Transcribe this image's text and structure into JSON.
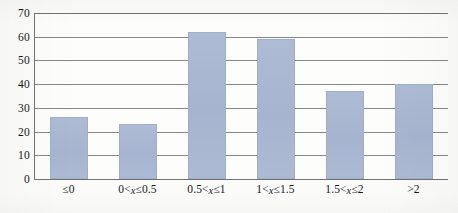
{
  "chart_data": {
    "type": "bar",
    "title": "",
    "subtitle": "",
    "xlabel": "",
    "ylabel": "",
    "categories": [
      "≤0",
      "0<x≤0.5",
      "0.5<x≤1",
      "1<x≤1.5",
      "1.5<x≤2",
      ">2"
    ],
    "category_parts": [
      {
        "pre": "≤0",
        "var": "",
        "post": ""
      },
      {
        "pre": "0<",
        "var": "x",
        "post": "≤0.5"
      },
      {
        "pre": "0.5<",
        "var": "x",
        "post": "≤1"
      },
      {
        "pre": "1<",
        "var": "x",
        "post": "≤1.5"
      },
      {
        "pre": "1.5<",
        "var": "x",
        "post": "≤2"
      },
      {
        "pre": ">2",
        "var": "",
        "post": ""
      }
    ],
    "values": [
      26,
      23,
      62,
      59,
      37,
      40
    ],
    "ylim": [
      0,
      70
    ],
    "ytick_labels": [
      "70",
      "60",
      "50",
      "40",
      "30",
      "20",
      "10",
      "0"
    ],
    "ytick_values": [
      70,
      60,
      50,
      40,
      30,
      20,
      10,
      0
    ],
    "grid": "horizontal",
    "legend": "none",
    "bar_color": "#a9b7d1",
    "axis_color": "#6f7276",
    "grid_color": "#83868b",
    "text_color": "#15181c",
    "background_color": "#fbfbfa"
  }
}
